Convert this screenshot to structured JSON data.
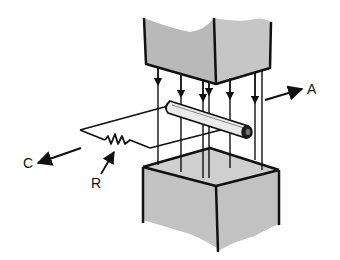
{
  "diagram": {
    "type": "magnetic-induction",
    "labels": {
      "A": "A",
      "C": "C",
      "R": "R"
    },
    "colors": {
      "pole_fill": "#b9b9b9",
      "stroke": "#111111",
      "background": "#ffffff",
      "rod_fill": "#e9e9e9"
    },
    "field_lines_count": 7
  }
}
